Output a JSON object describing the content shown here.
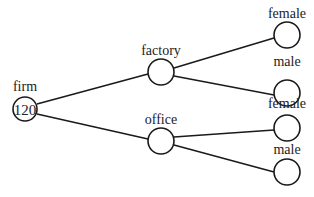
{
  "diagram": {
    "type": "tree",
    "root": {
      "label": "firm",
      "value": "120"
    },
    "level1": [
      {
        "label": "factory"
      },
      {
        "label": "office"
      }
    ],
    "leaves": [
      {
        "label": "female",
        "parent": "factory"
      },
      {
        "label": "male",
        "parent": "factory"
      },
      {
        "label": "female",
        "parent": "office"
      },
      {
        "label": "male",
        "parent": "office"
      }
    ]
  }
}
